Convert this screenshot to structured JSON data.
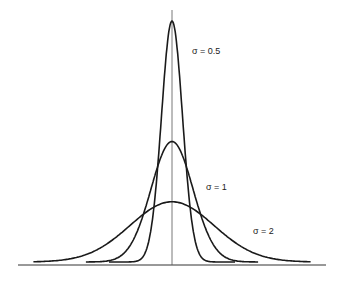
{
  "chart_data": {
    "type": "line",
    "title": "",
    "xlabel": "",
    "ylabel": "",
    "grid": false,
    "legend": "inline labels",
    "series": [
      {
        "name": "σ = 0.5",
        "sigma": 0.5,
        "peak": 0.798,
        "x_range": [
          -3,
          3
        ]
      },
      {
        "name": "σ = 1",
        "sigma": 1,
        "peak": 0.399,
        "x_range": [
          -4.1,
          4.1
        ]
      },
      {
        "name": "σ = 2",
        "sigma": 2,
        "peak": 0.199,
        "x_range": [
          -6.6,
          6.6
        ]
      }
    ],
    "annotations": [
      "σ = 0.5",
      "σ = 1",
      "σ = 2"
    ],
    "axes": {
      "horizontal_baseline": true,
      "vertical_center_line": true
    }
  },
  "labels": {
    "s05": "σ = 0.5",
    "s1": "σ = 1",
    "s2": "σ = 2"
  },
  "colors": {
    "line": "#1a1a1a",
    "background": "#ffffff"
  }
}
